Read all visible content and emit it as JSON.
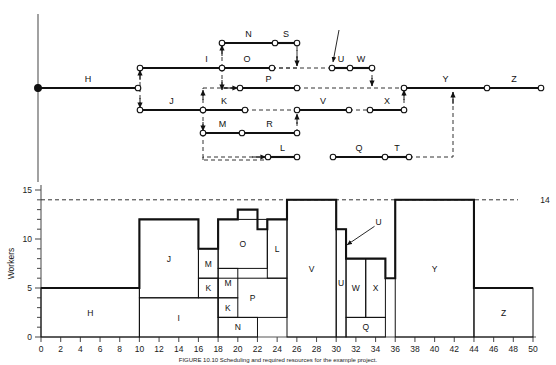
{
  "figure": {
    "caption": "FIGURE 10.10    Scheduling and required resources for the example project.",
    "threshold_label": "14"
  },
  "network": {
    "title": "activity-on-arrow network diagram",
    "activities": [
      "H",
      "I",
      "J",
      "K",
      "L",
      "M",
      "N",
      "O",
      "P",
      "Q",
      "R",
      "S",
      "T",
      "U",
      "V",
      "W",
      "X",
      "Y",
      "Z"
    ],
    "edges": [
      {
        "label": "H",
        "x1": 38,
        "y1": 88,
        "x2": 138,
        "y2": 88,
        "style": "solid"
      },
      {
        "label": "I",
        "x1": 140,
        "y1": 68,
        "x2": 273,
        "y2": 68,
        "style": "solid"
      },
      {
        "label": "J",
        "x1": 140,
        "y1": 110,
        "x2": 203,
        "y2": 110,
        "style": "solid"
      },
      {
        "label": "N",
        "x1": 222,
        "y1": 43,
        "x2": 275,
        "y2": 43,
        "style": "solid"
      },
      {
        "label": "S",
        "x1": 275,
        "y1": 43,
        "x2": 297,
        "y2": 43,
        "style": "solid"
      },
      {
        "label": "O",
        "x1": 222,
        "y1": 68,
        "x2": 272,
        "y2": 68,
        "style": "solid"
      },
      {
        "label": "P",
        "x1": 240,
        "y1": 88,
        "x2": 297,
        "y2": 88,
        "style": "solid"
      },
      {
        "label": "K",
        "x1": 203,
        "y1": 110,
        "x2": 245,
        "y2": 110,
        "style": "solid"
      },
      {
        "label": "M",
        "x1": 203,
        "y1": 133,
        "x2": 242,
        "y2": 133,
        "style": "solid"
      },
      {
        "label": "R",
        "x1": 242,
        "y1": 133,
        "x2": 297,
        "y2": 133,
        "style": "solid"
      },
      {
        "label": "V",
        "x1": 297,
        "y1": 110,
        "x2": 349,
        "y2": 110,
        "style": "solid"
      },
      {
        "label": "X",
        "x1": 370,
        "y1": 110,
        "x2": 404,
        "y2": 110,
        "style": "solid"
      },
      {
        "label": "U",
        "x1": 332,
        "y1": 68,
        "x2": 350,
        "y2": 68,
        "style": "solid"
      },
      {
        "label": "W",
        "x1": 350,
        "y1": 68,
        "x2": 372,
        "y2": 68,
        "style": "solid"
      },
      {
        "label": "L",
        "x1": 268,
        "y1": 157,
        "x2": 297,
        "y2": 157,
        "style": "solid"
      },
      {
        "label": "Q",
        "x1": 333,
        "y1": 157,
        "x2": 385,
        "y2": 157,
        "style": "solid"
      },
      {
        "label": "T",
        "x1": 385,
        "y1": 157,
        "x2": 409,
        "y2": 157,
        "style": "solid"
      },
      {
        "label": "Y",
        "x1": 404,
        "y1": 88,
        "x2": 487,
        "y2": 88,
        "style": "solid"
      },
      {
        "label": "Z",
        "x1": 487,
        "y1": 88,
        "x2": 541,
        "y2": 88,
        "style": "solid"
      }
    ],
    "nodes": [
      {
        "x": 38,
        "y": 88,
        "filled": true
      },
      {
        "x": 138,
        "y": 88,
        "filled": false
      },
      {
        "x": 140,
        "y": 68,
        "filled": false
      },
      {
        "x": 140,
        "y": 110,
        "filled": false
      },
      {
        "x": 203,
        "y": 110,
        "filled": false
      },
      {
        "x": 203,
        "y": 133,
        "filled": false
      },
      {
        "x": 222,
        "y": 43,
        "filled": false
      },
      {
        "x": 275,
        "y": 43,
        "filled": false
      },
      {
        "x": 297,
        "y": 43,
        "filled": false
      },
      {
        "x": 222,
        "y": 68,
        "filled": false
      },
      {
        "x": 272,
        "y": 68,
        "filled": false
      },
      {
        "x": 240,
        "y": 88,
        "filled": false
      },
      {
        "x": 297,
        "y": 88,
        "filled": false
      },
      {
        "x": 245,
        "y": 110,
        "filled": false
      },
      {
        "x": 297,
        "y": 110,
        "filled": false
      },
      {
        "x": 349,
        "y": 110,
        "filled": false
      },
      {
        "x": 370,
        "y": 110,
        "filled": false
      },
      {
        "x": 404,
        "y": 110,
        "filled": false
      },
      {
        "x": 242,
        "y": 133,
        "filled": false
      },
      {
        "x": 297,
        "y": 133,
        "filled": false
      },
      {
        "x": 350,
        "y": 68,
        "filled": false
      },
      {
        "x": 332,
        "y": 68,
        "filled": false
      },
      {
        "x": 372,
        "y": 68,
        "filled": false
      },
      {
        "x": 268,
        "y": 157,
        "filled": false
      },
      {
        "x": 297,
        "y": 157,
        "filled": false
      },
      {
        "x": 333,
        "y": 157,
        "filled": false
      },
      {
        "x": 385,
        "y": 157,
        "filled": false
      },
      {
        "x": 409,
        "y": 157,
        "filled": false
      },
      {
        "x": 404,
        "y": 88,
        "filled": false
      },
      {
        "x": 487,
        "y": 88,
        "filled": false
      },
      {
        "x": 541,
        "y": 88,
        "filled": false
      }
    ]
  },
  "chart_data": {
    "type": "bar",
    "xlabel": "",
    "ylabel": "Workers",
    "xlim": [
      0,
      50
    ],
    "ylim": [
      0,
      15
    ],
    "xticks": [
      0,
      2,
      4,
      6,
      8,
      10,
      12,
      14,
      16,
      18,
      20,
      22,
      24,
      26,
      28,
      30,
      32,
      34,
      36,
      38,
      40,
      42,
      44,
      46,
      48,
      50
    ],
    "yticks": [
      0,
      5,
      10,
      15
    ],
    "y_minor_step": 1,
    "grid": false,
    "threshold": 14,
    "threshold_label": "14",
    "profile": [
      {
        "x0": 0,
        "x1": 10,
        "total": 5
      },
      {
        "x0": 10,
        "x1": 16,
        "total": 12
      },
      {
        "x0": 16,
        "x1": 18,
        "total": 9
      },
      {
        "x0": 18,
        "x1": 20,
        "total": 12
      },
      {
        "x0": 20,
        "x1": 22,
        "total": 13
      },
      {
        "x0": 22,
        "x1": 23,
        "total": 11
      },
      {
        "x0": 23,
        "x1": 25,
        "total": 12
      },
      {
        "x0": 25,
        "x1": 30,
        "total": 14
      },
      {
        "x0": 30,
        "x1": 31,
        "total": 11
      },
      {
        "x0": 31,
        "x1": 35,
        "total": 8
      },
      {
        "x0": 35,
        "x1": 36,
        "total": 6
      },
      {
        "x0": 36,
        "x1": 44,
        "total": 14
      },
      {
        "x0": 44,
        "x1": 50,
        "total": 5
      }
    ],
    "blocks": [
      {
        "label": "H",
        "x0": 0,
        "x1": 10,
        "y0": 0,
        "y1": 5
      },
      {
        "label": "I",
        "x0": 10,
        "x1": 18,
        "y0": 0,
        "y1": 4
      },
      {
        "label": "J",
        "x0": 10,
        "x1": 16,
        "y0": 4,
        "y1": 12
      },
      {
        "label": "K",
        "x0": 16,
        "x1": 18,
        "y0": 4,
        "y1": 6
      },
      {
        "label": "M",
        "x0": 16,
        "x1": 18,
        "y0": 6,
        "y1": 9
      },
      {
        "label": "N",
        "x0": 18,
        "x1": 22,
        "y0": 0,
        "y1": 2
      },
      {
        "label": "K",
        "x0": 18,
        "x1": 20,
        "y0": 2,
        "y1": 4
      },
      {
        "label": "M",
        "x0": 18,
        "x1": 20,
        "y0": 4,
        "y1": 7
      },
      {
        "label": "P",
        "x0": 18,
        "x1": 25,
        "y0": 2,
        "y1": 6
      },
      {
        "label": "O",
        "x0": 18,
        "x1": 23,
        "y0": 7,
        "y1": 12
      },
      {
        "label": "L",
        "x0": 23,
        "x1": 25,
        "y0": 6,
        "y1": 12
      },
      {
        "label": "V",
        "x0": 25,
        "x1": 30,
        "y0": 0,
        "y1": 14
      },
      {
        "label": "U",
        "x0": 30,
        "x1": 31,
        "y0": 0,
        "y1": 11
      },
      {
        "label": "Q",
        "x0": 31,
        "x1": 35,
        "y0": 0,
        "y1": 2
      },
      {
        "label": "W",
        "x0": 31,
        "x1": 33,
        "y0": 2,
        "y1": 8
      },
      {
        "label": "X",
        "x0": 33,
        "x1": 35,
        "y0": 2,
        "y1": 8
      },
      {
        "label": "Y",
        "x0": 36,
        "x1": 44,
        "y0": 0,
        "y1": 14
      },
      {
        "label": "Z",
        "x0": 44,
        "x1": 50,
        "y0": 0,
        "y1": 5
      }
    ],
    "annotations": [
      {
        "label": "U",
        "tip_x": 31.0,
        "tip_y": 9.4,
        "text_x": 34.2,
        "text_y": 11.7
      }
    ]
  }
}
